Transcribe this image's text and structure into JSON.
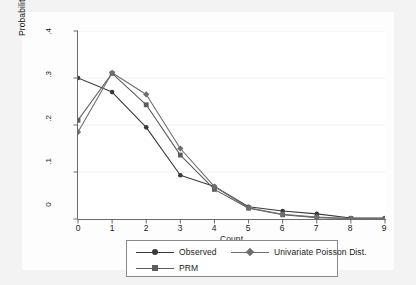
{
  "chart_data": {
    "type": "line",
    "title": "",
    "subtitle": "",
    "xlabel": "Count",
    "ylabel": "Probability of Count",
    "x": [
      0,
      1,
      2,
      3,
      4,
      5,
      6,
      7,
      8,
      9
    ],
    "xtick_labels": [
      "0",
      "1",
      "2",
      "3",
      "4",
      "5",
      "6",
      "7",
      "8",
      "9"
    ],
    "ytick_labels": [
      "0",
      ".1",
      ".2",
      ".3",
      ".4"
    ],
    "ytick_values": [
      0,
      0.1,
      0.2,
      0.3,
      0.4
    ],
    "xlim": [
      0,
      9
    ],
    "ylim": [
      0,
      0.4
    ],
    "grid": "horizontal-faint",
    "legend_position": "below-plot",
    "series": [
      {
        "name": "Observed",
        "marker": "circle",
        "color": "#3a3a3a",
        "values": [
          0.3,
          0.27,
          0.195,
          0.093,
          0.069,
          0.026,
          0.017,
          0.011,
          0.002,
          0.002
        ]
      },
      {
        "name": "PRM",
        "marker": "square",
        "color": "#5c5c5c",
        "values": [
          0.21,
          0.31,
          0.243,
          0.136,
          0.063,
          0.023,
          0.009,
          0.003,
          0.001,
          0.0
        ]
      },
      {
        "name": "Univariate Poisson Dist.",
        "marker": "diamond",
        "color": "#6e6e6e",
        "values": [
          0.185,
          0.311,
          0.265,
          0.15,
          0.069,
          0.024,
          0.01,
          0.004,
          0.001,
          0.0
        ]
      }
    ]
  },
  "legend": {
    "items": [
      {
        "label": "Observed"
      },
      {
        "label": "Univariate Poisson Dist."
      },
      {
        "label": "PRM"
      }
    ]
  },
  "axes": {
    "x_title": "Count",
    "y_title": "Probability of Count"
  },
  "colors": {
    "figure_background": "#f3f3f3",
    "canvas_background": "#fdfdfd",
    "plot_background": "#ffffff",
    "axis_line": "#6b6b6b",
    "gridline": "#f0f0f0",
    "text": "#1a1a1a",
    "legend_border": "#8a8a8a"
  }
}
